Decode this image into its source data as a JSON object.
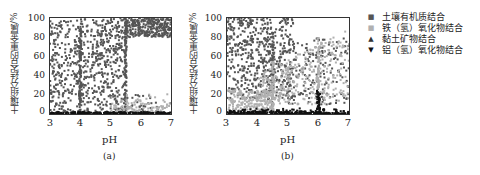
{
  "legend": {
    "items": [
      {
        "label": "土壤有机质结合",
        "marker": "■",
        "color": "#555555"
      },
      {
        "label": "铁（氢）氧化物结合",
        "marker": "■",
        "color": "#b0b0b0"
      },
      {
        "label": "黏土矿物结合",
        "marker": "▲",
        "color": "#333333"
      },
      {
        "label": "铝（氢）氧化物结合",
        "marker": "▼",
        "color": "#111111"
      }
    ]
  },
  "panels": [
    {
      "caption": "(a)",
      "ylabel": "土壤组分结合的重金属/%",
      "xlabel": "pH",
      "yticks": [
        "100",
        "80",
        "60",
        "40",
        "20",
        "0"
      ],
      "xticks": [
        "3",
        "4",
        "5",
        "6",
        "7"
      ]
    },
    {
      "caption": "(b)",
      "ylabel": "土壤组分结合的重金属/%",
      "xlabel": "pH",
      "yticks": [
        "100",
        "80",
        "60",
        "40",
        "20",
        "0"
      ],
      "xticks": [
        "3",
        "4",
        "5",
        "6",
        "7"
      ]
    }
  ],
  "chart_data": [
    {
      "type": "scatter",
      "title": "(a)",
      "xlabel": "pH",
      "ylabel": "土壤组分结合的重金属/%",
      "xlim": [
        3,
        7
      ],
      "ylim": [
        0,
        100
      ],
      "legend_position": "right",
      "series": [
        {
          "name": "土壤有机质结合",
          "description": "dense dark scatter spanning 0-100% from pH 3 to ~5.5; concentrated 80-100% for pH 5.5-7; vertical clusters near pH 4 and 5.5",
          "x": [
            3.1,
            3.2,
            3.3,
            3.5,
            3.7,
            3.9,
            4.0,
            4.0,
            4.1,
            4.3,
            4.5,
            4.7,
            4.9,
            5.1,
            5.3,
            5.5,
            5.5,
            5.7,
            5.9,
            6.1,
            6.3,
            6.5,
            6.7,
            6.9
          ],
          "y": [
            70,
            25,
            85,
            50,
            60,
            40,
            80,
            20,
            55,
            65,
            45,
            75,
            30,
            90,
            35,
            95,
            20,
            95,
            92,
            90,
            93,
            90,
            88,
            90
          ]
        },
        {
          "name": "铁（氢）氧化物结合",
          "description": "light grey points mostly 0-20% at pH 5-7",
          "x": [
            5.2,
            5.6,
            6.0,
            6.4,
            6.8,
            6.9
          ],
          "y": [
            3,
            6,
            8,
            5,
            12,
            20
          ]
        },
        {
          "name": "黏土矿物结合",
          "description": "few points, near zero",
          "x": [
            5.0,
            6.2,
            6.6
          ],
          "y": [
            2,
            4,
            8
          ]
        },
        {
          "name": "铝（氢）氧化物结合",
          "description": "dense band at ~0% across all pH",
          "x": [
            3,
            4,
            5,
            6,
            7
          ],
          "y": [
            0,
            0,
            0,
            0,
            0
          ]
        }
      ]
    },
    {
      "type": "scatter",
      "title": "(b)",
      "xlabel": "pH",
      "ylabel": "土壤组分结合的重金属/%",
      "xlim": [
        3,
        7
      ],
      "ylim": [
        0,
        100
      ],
      "legend_position": "right",
      "series": [
        {
          "name": "土壤有机质结合",
          "description": "dark scatter 20-100% across pH 3-5, spreading thinner toward pH 7",
          "x": [
            3.1,
            3.3,
            3.5,
            3.8,
            4.0,
            4.2,
            4.5,
            4.5,
            4.8,
            5.0,
            5.4,
            5.8,
            6.2,
            6.6,
            6.9
          ],
          "y": [
            60,
            30,
            85,
            75,
            95,
            70,
            80,
            40,
            55,
            65,
            50,
            70,
            35,
            30,
            20
          ]
        },
        {
          "name": "铁（氢）氧化物结合",
          "description": "light grey points rising from 0-20% at pH 3-4 to 40-80% at pH 5-7; vertical clusters near pH 4.5 and 6",
          "x": [
            3.2,
            3.6,
            4.0,
            4.4,
            4.5,
            4.8,
            5.2,
            5.6,
            6.0,
            6.0,
            6.4,
            6.8
          ],
          "y": [
            5,
            10,
            15,
            25,
            50,
            35,
            45,
            55,
            60,
            75,
            65,
            80
          ]
        },
        {
          "name": "黏土矿物结合",
          "description": "few scattered points at low values",
          "x": [
            3.5,
            4.2,
            5.0
          ],
          "y": [
            5,
            8,
            3
          ]
        },
        {
          "name": "铝（氢）氧化物结合",
          "description": "black band near 0-5% across all pH; vertical spike up to ~25% at pH 6",
          "x": [
            3,
            4,
            5,
            6,
            6,
            7
          ],
          "y": [
            1,
            2,
            3,
            25,
            5,
            4
          ]
        }
      ]
    }
  ]
}
